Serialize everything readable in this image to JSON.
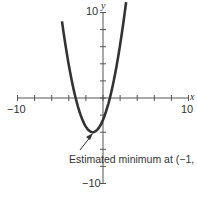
{
  "chart_data": {
    "type": "line",
    "title": "",
    "xlabel": "x",
    "ylabel": "y",
    "xlim": [
      -10,
      10
    ],
    "ylim": [
      -10,
      10
    ],
    "x_tick_step": 2,
    "y_tick_step": 2,
    "x_tick_labels": [
      "-10",
      "10"
    ],
    "y_tick_labels": [
      "10",
      "-10"
    ],
    "grid": false,
    "series": [
      {
        "name": "parabola",
        "function": "y = (x+1)^2 - 4",
        "x": [
          -4.8,
          -4,
          -3,
          -2,
          -1,
          0,
          1,
          2.6
        ],
        "y": [
          10.4,
          5,
          0,
          -3,
          -4,
          -3,
          0,
          9
        ]
      }
    ],
    "annotations": [
      {
        "text": "Estimated minimum at (−1, −4)",
        "point": [
          -1,
          -4
        ],
        "arrow": true
      }
    ]
  },
  "labels": {
    "x_axis": "x",
    "y_axis": "y",
    "x_min": "−10",
    "x_max": "10",
    "y_max": "10",
    "y_min": "−10",
    "annotation": "Estimated minimum at (−1, −4)"
  },
  "colors": {
    "curve": "#333333",
    "axis": "#555555"
  }
}
